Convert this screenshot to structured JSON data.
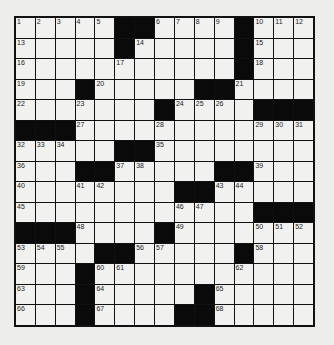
{
  "puzzle": {
    "rows": 15,
    "cols": 15,
    "grid": [
      ".....##....#...",
      ".....#.....#...",
      "...........#...",
      "...#.....##....",
      ".......#....###",
      "###............",
      ".....##........",
      "...##.....##...",
      "........##.....",
      "............###",
      "###....#.......",
      "....##.....#...",
      "...#...........",
      "...#.....#.....",
      "...#....##....."
    ],
    "numbers": [
      {
        "0": 1,
        "1": 2,
        "2": 3,
        "3": 4,
        "4": 5,
        "7": 6,
        "8": 7,
        "9": 8,
        "10": 9,
        "12": 10,
        "13": 11,
        "14": 12
      },
      {
        "0": 13,
        "6": 14,
        "12": 15
      },
      {
        "0": 16,
        "5": 17,
        "12": 18
      },
      {
        "0": 19,
        "4": 20,
        "11": 21
      },
      {
        "0": 22,
        "3": 23,
        "8": 24,
        "9": 25,
        "10": 26
      },
      {
        "3": 27,
        "7": 28,
        "12": 29,
        "13": 30,
        "14": 31
      },
      {
        "0": 32,
        "1": 33,
        "2": 34,
        "7": 35
      },
      {
        "0": 36,
        "5": 37,
        "6": 38,
        "12": 39
      },
      {
        "0": 40,
        "3": 41,
        "4": 42,
        "10": 43,
        "11": 44
      },
      {
        "0": 45,
        "8": 46,
        "9": 47
      },
      {
        "3": 48,
        "8": 49,
        "12": 50,
        "13": 51,
        "14": 52
      },
      {
        "0": 53,
        "1": 54,
        "2": 55,
        "6": 56,
        "7": 57,
        "12": 58
      },
      {
        "0": 59,
        "4": 60,
        "5": 61,
        "11": 62
      },
      {
        "0": 63,
        "4": 64,
        "10": 65
      },
      {
        "0": 66,
        "4": 67,
        "10": 68
      }
    ],
    "colors": {
      "black_square": "#0a0a0a",
      "white_square": "#f1f1f0",
      "grid_line": "#111111",
      "background": "#ededec"
    }
  }
}
